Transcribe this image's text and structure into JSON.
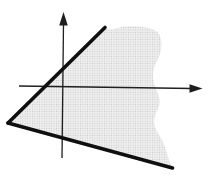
{
  "figure": {
    "width": 211,
    "height": 177,
    "background_color": "#ffffff",
    "region": {
      "name": "stippled-region",
      "path": "M 9 122.5 L 104 28 C 111 32 118 26.5 128 26.2 C 139 25.8 150.5 27.2 156 31 C 161.5 34.8 162.3 43 160.7 51 C 158.8 61 152.6 65 153.1 76 C 153.6 87 158.6 92 159.6 100 C 160.6 108 154.1 113 154.1 121 C 154.1 131 162.1 137 164.6 146 C 166.6 153 168.8 159.5 171.2 166.2 L 8 123 Z",
      "base_color": "#eeeeee",
      "dot_color": "#c4c4c4",
      "dot_spacing": 2.4,
      "dot_radius": 0.55
    },
    "axes": {
      "color": "#1f1f1f",
      "stroke_width": 1.3,
      "x_axis": {
        "x1": 19,
        "y1": 86,
        "x2": 192,
        "y2": 88.5
      },
      "x_arrowhead_points": "202.5,88.5 189.5,84.3 189.5,92.7",
      "y_axis": {
        "x1": 63.5,
        "y1": 23,
        "x2": 62,
        "y2": 158
      },
      "y_arrowhead_points": "63.5,12 59.2,25.5 67.8,25.5"
    },
    "boundary_lines": {
      "color": "#0f0f0f",
      "stroke_width": 3.6,
      "upper_line": {
        "x1": 8,
        "y1": 123,
        "x2": 105,
        "y2": 27.5
      },
      "lower_line": {
        "x1": 8,
        "y1": 123,
        "x2": 172.5,
        "y2": 168
      }
    }
  }
}
